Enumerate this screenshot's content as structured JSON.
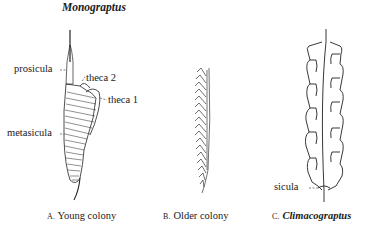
{
  "figure": {
    "title": "Monograptus",
    "panels": [
      {
        "id": "A",
        "letter": "A.",
        "caption": "Young colony",
        "labels": {
          "prosicula": "prosicula",
          "theca2": "theca 2",
          "theca1": "theca 1",
          "metasicula": "metasicula"
        }
      },
      {
        "id": "B",
        "letter": "B.",
        "caption": "Older colony"
      },
      {
        "id": "C",
        "letter": "C.",
        "caption": "Climacograptus",
        "labels": {
          "sicula": "sicula"
        }
      }
    ]
  }
}
